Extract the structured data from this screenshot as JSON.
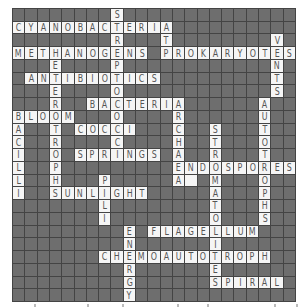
{
  "puzzle": {
    "type": "crossword",
    "rows": 23,
    "cols": 23,
    "colors": {
      "block": "#6e6e6e",
      "open": "#f5f5f5",
      "gridline": "#444444",
      "letter": "#555555"
    },
    "words": [
      {
        "text": "STREPTOCOCCI",
        "row": 0,
        "col": 8,
        "dir": "down"
      },
      {
        "text": "CYANOBACTERIA",
        "row": 1,
        "col": 0,
        "dir": "across"
      },
      {
        "text": "ATP",
        "row": 1,
        "col": 12,
        "dir": "down"
      },
      {
        "text": "VENTS",
        "row": 2,
        "col": 21,
        "dir": "down"
      },
      {
        "text": "METHANOGENS",
        "row": 3,
        "col": 0,
        "dir": "across"
      },
      {
        "text": "PROKARYOTES",
        "row": 3,
        "col": 12,
        "dir": "across"
      },
      {
        "text": "HETEROTROPHS",
        "row": 3,
        "col": 3,
        "dir": "down"
      },
      {
        "text": "ANTIBIOTICS",
        "row": 5,
        "col": 1,
        "dir": "across"
      },
      {
        "text": "BACTERIA",
        "row": 7,
        "col": 6,
        "dir": "across"
      },
      {
        "text": "ARCHAEA",
        "row": 7,
        "col": 13,
        "dir": "down"
      },
      {
        "text": "AUTOTROPHS",
        "row": 7,
        "col": 20,
        "dir": "down"
      },
      {
        "text": "BLOOM",
        "row": 8,
        "col": 0,
        "dir": "across"
      },
      {
        "text": "BACILLI",
        "row": 8,
        "col": 0,
        "dir": "down"
      },
      {
        "text": "COCCI",
        "row": 9,
        "col": 5,
        "dir": "across"
      },
      {
        "text": "STROMATOLITES",
        "row": 9,
        "col": 16,
        "dir": "down"
      },
      {
        "text": "SPRINGS",
        "row": 11,
        "col": 5,
        "dir": "across"
      },
      {
        "text": "ENDOSPORES",
        "row": 12,
        "col": 13,
        "dir": "across"
      },
      {
        "text": "PILI",
        "row": 13,
        "col": 7,
        "dir": "down"
      },
      {
        "text": "SUNLIGHT",
        "row": 14,
        "col": 3,
        "dir": "across"
      },
      {
        "text": "ENERGY",
        "row": 17,
        "col": 9,
        "dir": "down"
      },
      {
        "text": "FLAGELLUM",
        "row": 17,
        "col": 11,
        "dir": "across"
      },
      {
        "text": "CHEMOAUTOTROPH",
        "row": 19,
        "col": 7,
        "dir": "across"
      },
      {
        "text": "SPIRAL",
        "row": 21,
        "col": 16,
        "dir": "across"
      }
    ],
    "blank_open_cells": [
      {
        "row": 13,
        "col": 14
      }
    ]
  },
  "footer": {
    "marks_x": [
      22,
      75,
      110,
      165,
      195,
      262,
      284
    ]
  }
}
